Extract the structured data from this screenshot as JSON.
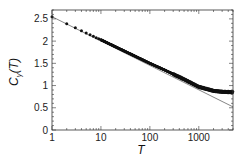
{
  "chart_data": {
    "type": "line",
    "title": "",
    "xlabel": "T",
    "ylabel": "C_γ(T)",
    "xscale": "log",
    "xlim": [
      1,
      5000
    ],
    "ylim": [
      0,
      2.7
    ],
    "xticks": [
      "1",
      "10",
      "100",
      "1000"
    ],
    "yticks": [
      "0",
      "0.5",
      "1",
      "1.5",
      "2",
      "2.5"
    ],
    "grid": false,
    "legend": null,
    "series": [
      {
        "name": "data",
        "style": "markers (dense black dots)",
        "x": [
          1,
          2,
          3,
          5,
          10,
          20,
          50,
          100,
          200,
          500,
          1000,
          2000,
          3000,
          5000
        ],
        "y": [
          2.55,
          2.39,
          2.3,
          2.18,
          2.03,
          1.87,
          1.66,
          1.5,
          1.35,
          1.14,
          0.97,
          0.88,
          0.86,
          0.85
        ]
      },
      {
        "name": "log fit",
        "style": "thin gray line",
        "x": [
          1,
          5000
        ],
        "y": [
          2.55,
          0.52
        ]
      }
    ]
  },
  "labels": {
    "x_title": "T",
    "y_title_main": "C",
    "y_title_sub": "γ",
    "y_title_arg": "(T)"
  }
}
